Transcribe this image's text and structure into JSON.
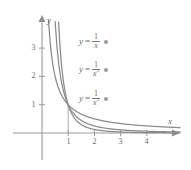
{
  "chart_data": {
    "type": "line",
    "title": "",
    "subtitle": "",
    "xlabel": "x",
    "ylabel": "y",
    "xlim": [
      -0.55,
      5.2
    ],
    "ylim": [
      -0.55,
      4.2
    ],
    "grid": false,
    "legend_position": "inside-right",
    "x_ticks": [
      1,
      2,
      3,
      4
    ],
    "x_tick_labels": [
      "1",
      "2",
      "3",
      "4"
    ],
    "y_ticks": [
      1,
      2,
      3
    ],
    "y_tick_labels": [
      "1",
      "2",
      "3"
    ],
    "annotations": [
      {
        "text": "vertical segment at x = 1 from y = 0 to y = 1",
        "x": 1
      }
    ],
    "series": [
      {
        "name": "y = 1/x",
        "formula": "1/x",
        "exponent": 1,
        "color": "#8a8a8a",
        "x": [
          0.25,
          0.3,
          0.35,
          0.4,
          0.5,
          0.6,
          0.7,
          0.8,
          0.9,
          1.0,
          1.25,
          1.5,
          1.75,
          2.0,
          2.5,
          3.0,
          3.5,
          4.0,
          4.5,
          5.0
        ],
        "y": [
          4.0,
          3.33,
          2.86,
          2.5,
          2.0,
          1.67,
          1.43,
          1.25,
          1.11,
          1.0,
          0.8,
          0.67,
          0.57,
          0.5,
          0.4,
          0.33,
          0.29,
          0.25,
          0.22,
          0.2
        ]
      },
      {
        "name": "y = 1/x^2",
        "formula": "1/x^2",
        "exponent": 2,
        "color": "#8a8a8a",
        "x": [
          0.5,
          0.55,
          0.6,
          0.65,
          0.7,
          0.8,
          0.9,
          1.0,
          1.25,
          1.5,
          1.75,
          2.0,
          2.5,
          3.0,
          3.5,
          4.0,
          4.5,
          5.0
        ],
        "y": [
          4.0,
          3.31,
          2.78,
          2.37,
          2.04,
          1.56,
          1.23,
          1.0,
          0.64,
          0.44,
          0.33,
          0.25,
          0.16,
          0.11,
          0.08,
          0.06,
          0.05,
          0.04
        ]
      },
      {
        "name": "y = 1/x^3",
        "formula": "1/x^3",
        "exponent": 3,
        "color": "#8a8a8a",
        "x": [
          0.63,
          0.66,
          0.7,
          0.75,
          0.8,
          0.85,
          0.9,
          0.95,
          1.0,
          1.25,
          1.5,
          1.75,
          2.0,
          2.5,
          3.0,
          3.5,
          4.0,
          4.5,
          5.0
        ],
        "y": [
          4.0,
          3.48,
          2.92,
          2.37,
          1.95,
          1.63,
          1.37,
          1.17,
          1.0,
          0.51,
          0.3,
          0.19,
          0.13,
          0.06,
          0.04,
          0.02,
          0.02,
          0.01,
          0.01
        ]
      }
    ]
  },
  "labels": {
    "y_axis_name": "y",
    "x_axis_name": "x",
    "equations": [
      {
        "lhs": "y",
        "rel": "=",
        "numerator": "1",
        "denominator": "x",
        "power": "",
        "marker": "dot-marker"
      },
      {
        "lhs": "y",
        "rel": "=",
        "numerator": "1",
        "denominator": "x",
        "power": "2",
        "marker": "dot-marker"
      },
      {
        "lhs": "y",
        "rel": "=",
        "numerator": "1",
        "denominator": "x",
        "power": "3",
        "marker": "dot-marker"
      }
    ]
  },
  "colors": {
    "background": "#ffffff",
    "axis": "#9a9a9a",
    "curve": "#8a8a8a",
    "text": "#6b6b6b"
  }
}
